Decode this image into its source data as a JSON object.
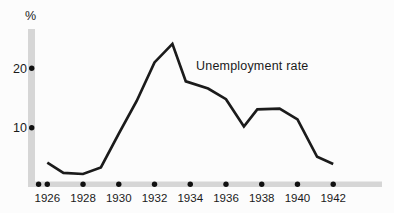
{
  "chart_data": {
    "type": "line",
    "title": "",
    "annotation": "Unemployment rate",
    "y_axis_unit_label": "%",
    "xlabel": "",
    "ylabel": "%",
    "x_ticks": [
      1926,
      1928,
      1930,
      1932,
      1934,
      1936,
      1938,
      1940,
      1942
    ],
    "x_tick_labels": [
      "1926",
      "1928",
      "1930",
      "1932",
      "1934",
      "1936",
      "1938",
      "1940",
      "1942"
    ],
    "y_ticks": [
      10,
      20
    ],
    "y_tick_labels": [
      "10",
      "20"
    ],
    "xlim": [
      1925.5,
      1943
    ],
    "ylim": [
      0,
      26.5
    ],
    "grid": false,
    "legend": "none",
    "series": [
      {
        "name": "Unemployment rate",
        "points": [
          [
            1926,
            4.1
          ],
          [
            1926.9,
            2.4
          ],
          [
            1928,
            2.2
          ],
          [
            1929,
            3.3
          ],
          [
            1930,
            9.0
          ],
          [
            1931,
            14.5
          ],
          [
            1932,
            21.0
          ],
          [
            1933,
            24.1
          ],
          [
            1933.75,
            17.8
          ],
          [
            1935,
            16.6
          ],
          [
            1936,
            14.8
          ],
          [
            1937,
            10.2
          ],
          [
            1937.75,
            13.1
          ],
          [
            1939,
            13.2
          ],
          [
            1940,
            11.4
          ],
          [
            1941.1,
            5.1
          ],
          [
            1942,
            3.9
          ]
        ]
      }
    ],
    "colors": {
      "line": "#1b1b1b",
      "axis_bar": "#d6d6d6",
      "tick_dot": "#111111",
      "text": "#1a1a1a",
      "background": "#fcfcfc"
    }
  }
}
